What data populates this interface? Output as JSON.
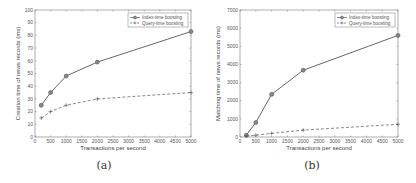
{
  "chart_data": [
    {
      "type": "line",
      "caption": "(a)",
      "title": "",
      "xlabel": "Transactions per second",
      "ylabel": "Creation time of news records (ms)",
      "xlim": [
        0,
        5000
      ],
      "ylim": [
        0,
        100
      ],
      "xticks": [
        0,
        500,
        1000,
        1500,
        2000,
        2500,
        3000,
        3500,
        4000,
        4500,
        5000
      ],
      "yticks": [
        0,
        10,
        20,
        30,
        40,
        50,
        60,
        70,
        80,
        90,
        100
      ],
      "grid": false,
      "legend_position": "upper right",
      "x": [
        200,
        500,
        1000,
        2000,
        5000
      ],
      "series": [
        {
          "name": "Index-time boosting",
          "style": "solid",
          "marker": "circle",
          "values": [
            25,
            35,
            48,
            59,
            83
          ]
        },
        {
          "name": "Query-time boosting",
          "style": "dashed",
          "marker": "plus",
          "values": [
            15,
            20,
            25,
            30,
            35
          ]
        }
      ]
    },
    {
      "type": "line",
      "caption": "(b)",
      "title": "",
      "xlabel": "Transactions per second",
      "ylabel": "Matching time of news records (ms)",
      "xlim": [
        0,
        5000
      ],
      "ylim": [
        0,
        7000
      ],
      "xticks": [
        0,
        500,
        1000,
        1500,
        2000,
        2500,
        3000,
        3500,
        4000,
        4500,
        5000
      ],
      "yticks": [
        0,
        1000,
        2000,
        3000,
        4000,
        5000,
        6000,
        7000
      ],
      "grid": false,
      "legend_position": "upper right",
      "x": [
        200,
        500,
        1000,
        2000,
        5000
      ],
      "series": [
        {
          "name": "Index-time boosting",
          "style": "solid",
          "marker": "circle",
          "values": [
            100,
            800,
            2350,
            3680,
            5600
          ]
        },
        {
          "name": "Query-time boosting",
          "style": "dashed",
          "marker": "plus",
          "values": [
            50,
            100,
            200,
            380,
            700
          ]
        }
      ]
    }
  ],
  "colors": {
    "line": "#555555",
    "axis": "#777777",
    "text": "#444444"
  }
}
